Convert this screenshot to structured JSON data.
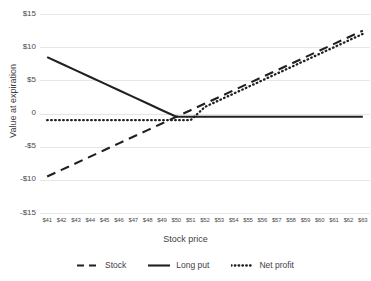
{
  "chart_data": {
    "type": "line",
    "title": "",
    "xlabel": "Stock price",
    "ylabel": "Value at expiration",
    "xlim": [
      41,
      63
    ],
    "ylim": [
      -15,
      15
    ],
    "grid": true,
    "legend_position": "bottom-center",
    "categories": [
      "$41",
      "$42",
      "$43",
      "$44",
      "$45",
      "$46",
      "$47",
      "$48",
      "$49",
      "$50",
      "$51",
      "$52",
      "$53",
      "$54",
      "$55",
      "$56",
      "$57",
      "$58",
      "$59",
      "$60",
      "$61",
      "$62",
      "$63"
    ],
    "x": [
      41,
      42,
      43,
      44,
      45,
      46,
      47,
      48,
      49,
      50,
      51,
      52,
      53,
      54,
      55,
      56,
      57,
      58,
      59,
      60,
      61,
      62,
      63
    ],
    "ytick_labels": [
      "$15",
      "$10",
      "$5",
      "0",
      "-$5",
      "-$10",
      "-$15"
    ],
    "ytick_values": [
      15,
      10,
      5,
      0,
      -5,
      -10,
      -15
    ],
    "series": [
      {
        "name": "Stock",
        "style": "dashed",
        "color": "#231f20",
        "values": [
          -9.5,
          -8.5,
          -7.5,
          -6.5,
          -5.5,
          -4.5,
          -3.5,
          -2.5,
          -1.5,
          -0.5,
          0.5,
          1.5,
          2.5,
          3.5,
          4.5,
          5.5,
          6.5,
          7.5,
          8.5,
          9.5,
          10.5,
          11.5,
          12.5
        ]
      },
      {
        "name": "Long put",
        "style": "solid",
        "color": "#231f20",
        "values": [
          8.5,
          7.5,
          6.5,
          5.5,
          4.5,
          3.5,
          2.5,
          1.5,
          0.5,
          -0.5,
          -0.5,
          -0.5,
          -0.5,
          -0.5,
          -0.5,
          -0.5,
          -0.5,
          -0.5,
          -0.5,
          -0.5,
          -0.5,
          -0.5,
          -0.5
        ]
      },
      {
        "name": "Net profit",
        "style": "dotted",
        "color": "#231f20",
        "values": [
          -1,
          -1,
          -1,
          -1,
          -1,
          -1,
          -1,
          -1,
          -1,
          -1,
          -1,
          1,
          2,
          3,
          4,
          5,
          6,
          7,
          8,
          9,
          10,
          11,
          12
        ]
      }
    ]
  },
  "axes": {
    "y_title": "Value at expiration",
    "x_title": "Stock price",
    "y_ticks": [
      {
        "label": "$15"
      },
      {
        "label": "$10"
      },
      {
        "label": "$5"
      },
      {
        "label": "0"
      },
      {
        "label": "-$5"
      },
      {
        "label": "-$10"
      },
      {
        "label": "-$15"
      }
    ],
    "x_ticks": [
      {
        "label": "$41"
      },
      {
        "label": "$42"
      },
      {
        "label": "$43"
      },
      {
        "label": "$44"
      },
      {
        "label": "$45"
      },
      {
        "label": "$46"
      },
      {
        "label": "$47"
      },
      {
        "label": "$48"
      },
      {
        "label": "$49"
      },
      {
        "label": "$50"
      },
      {
        "label": "$51"
      },
      {
        "label": "$52"
      },
      {
        "label": "$53"
      },
      {
        "label": "$54"
      },
      {
        "label": "$55"
      },
      {
        "label": "$56"
      },
      {
        "label": "$57"
      },
      {
        "label": "$58"
      },
      {
        "label": "$59"
      },
      {
        "label": "$60"
      },
      {
        "label": "$61"
      },
      {
        "label": "$62"
      },
      {
        "label": "$63"
      }
    ]
  },
  "legend": {
    "items": [
      {
        "label": "Stock",
        "style": "dashed"
      },
      {
        "label": "Long put",
        "style": "solid"
      },
      {
        "label": "Net profit",
        "style": "dotted"
      }
    ]
  },
  "colors": {
    "line": "#231f20",
    "grid": "#e4e6e8",
    "text": "#3f4044",
    "background": "#ffffff"
  }
}
